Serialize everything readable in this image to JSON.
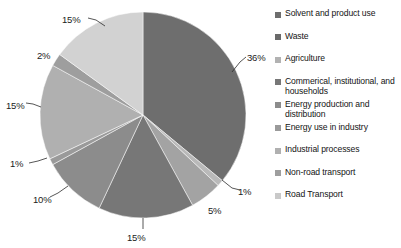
{
  "chart_data": {
    "type": "pie",
    "title": "",
    "legend_position": "right",
    "total": 100,
    "unit": "%",
    "categories": [
      "Solvent and product use",
      "Waste",
      "Agriculture",
      "Commerical, institutional, and households",
      "Energy production and distribution",
      "Energy use in industry",
      "Industrial processes",
      "Non-road transport",
      "Road Transport"
    ],
    "values": [
      36,
      1,
      5,
      15,
      10,
      1,
      15,
      2,
      15
    ],
    "labels": [
      "36%",
      "1%",
      "5%",
      "15%",
      "10%",
      "1%",
      "15%",
      "2%",
      "15%"
    ],
    "colors": [
      "#6e6e6e",
      "#b9b9b9",
      "#a3a3a3",
      "#777777",
      "#8c8c8c",
      "#9a9a9a",
      "#b0b0b0",
      "#9e9e9e",
      "#d2d2d2"
    ]
  },
  "legend": {
    "items": [
      {
        "label": "Solvent and product use",
        "color": "#6e6e6e"
      },
      {
        "label": "Waste",
        "color": "#6a6a6a"
      },
      {
        "label": "Agriculture",
        "color": "#b2b2b2"
      },
      {
        "label": "Commerical, institutional, and households",
        "color": "#777777"
      },
      {
        "label": "Energy production and distribution",
        "color": "#8c8c8c"
      },
      {
        "label": "Energy use in industry",
        "color": "#9a9a9a"
      },
      {
        "label": "Industrial processes",
        "color": "#b0b0b0"
      },
      {
        "label": "Non-road transport",
        "color": "#9e9e9e"
      },
      {
        "label": "Road Transport",
        "color": "#c9c9c9"
      }
    ]
  },
  "pie_labels": [
    {
      "text": "36%",
      "left": 247,
      "top": 52
    },
    {
      "text": "1%",
      "left": 238,
      "top": 186
    },
    {
      "text": "5%",
      "left": 208,
      "top": 205
    },
    {
      "text": "15%",
      "left": 127,
      "top": 232
    },
    {
      "text": "10%",
      "left": 33,
      "top": 194
    },
    {
      "text": "1%",
      "left": 10,
      "top": 158
    },
    {
      "text": "15%",
      "left": 6,
      "top": 100
    },
    {
      "text": "2%",
      "left": 37,
      "top": 50
    },
    {
      "text": "15%",
      "left": 62,
      "top": 14
    }
  ],
  "geometry": {
    "cx": 143,
    "cy": 115,
    "r": 103
  }
}
